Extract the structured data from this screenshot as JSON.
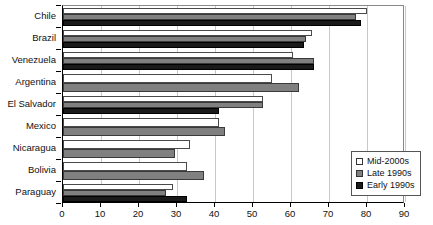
{
  "chart_data": {
    "type": "bar",
    "orientation": "horizontal",
    "title": "",
    "xlabel": "",
    "ylabel": "",
    "xlim": [
      0,
      90
    ],
    "xticks": [
      0,
      10,
      20,
      30,
      40,
      50,
      60,
      70,
      80,
      90
    ],
    "grid": true,
    "legend_position": "bottom-right",
    "categories": [
      "Chile",
      "Brazil",
      "Venezuela",
      "Argentina",
      "El Salvador",
      "Mexico",
      "Nicaragua",
      "Bolivia",
      "Paraguay"
    ],
    "series": [
      {
        "name": "Mid-2000s",
        "color": "#ffffff",
        "values": [
          80.0,
          65.5,
          60.5,
          55.0,
          52.5,
          41.0,
          33.5,
          32.5,
          29.0
        ]
      },
      {
        "name": "Late 1990s",
        "color": "#808080",
        "values": [
          77.0,
          64.0,
          66.0,
          62.0,
          52.5,
          42.5,
          29.5,
          37.0,
          27.0
        ]
      },
      {
        "name": "Early 1990s",
        "color": "#1a1a1a",
        "values": [
          78.5,
          63.5,
          66.0,
          null,
          41.0,
          null,
          null,
          null,
          32.5
        ]
      }
    ]
  },
  "legend": {
    "items": [
      {
        "label": "Mid-2000s",
        "swatch": "white-square-icon"
      },
      {
        "label": "Late 1990s",
        "swatch": "gray-square-icon"
      },
      {
        "label": "Early 1990s",
        "swatch": "black-square-icon"
      }
    ]
  }
}
